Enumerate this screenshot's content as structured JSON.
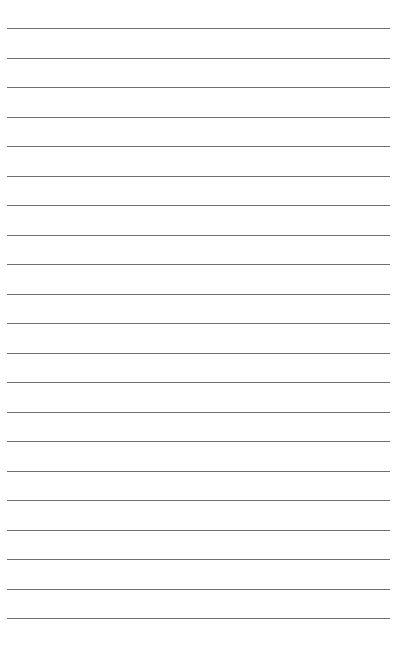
{
  "document": {
    "type": "lined-paper",
    "top_text_fragment": "",
    "rule_color": "#6e6e6e",
    "rule_count": 21,
    "first_rule_y": 28,
    "rule_spacing": 29.5,
    "rule_left": 7,
    "rule_right": 390
  }
}
